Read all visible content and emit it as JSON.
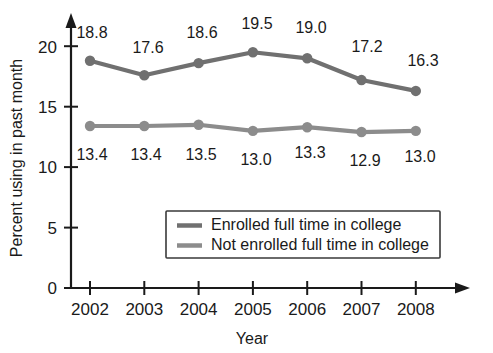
{
  "chart_data": {
    "type": "line",
    "title": "",
    "subtitle": "",
    "xlabel": "Year",
    "ylabel": "Percent using in past month",
    "categories": [
      "2002",
      "2003",
      "2004",
      "2005",
      "2006",
      "2007",
      "2008"
    ],
    "x": [
      2002,
      2003,
      2004,
      2005,
      2006,
      2007,
      2008
    ],
    "xlim": [
      2001.55,
      2008.7
    ],
    "ylim": [
      0,
      21.5
    ],
    "yticks": [
      0,
      5,
      10,
      15,
      20
    ],
    "ytick_labels": [
      "0",
      "5",
      "10",
      "15",
      "20"
    ],
    "xticks": [
      2002,
      2003,
      2004,
      2005,
      2006,
      2007,
      2008
    ],
    "grid": false,
    "legend_position": "inside-lower-center",
    "series": [
      {
        "name": "Enrolled full time in college",
        "color": "#707070",
        "marker": "circle",
        "values": [
          18.8,
          17.6,
          18.6,
          19.5,
          19.0,
          17.2,
          16.3
        ],
        "data_labels": [
          "18.8",
          "17.6",
          "18.6",
          "19.5",
          "19.0",
          "17.2",
          "16.3"
        ],
        "label_position": "above"
      },
      {
        "name": "Not enrolled full time in college",
        "color": "#8c8c8c",
        "marker": "circle",
        "values": [
          13.4,
          13.4,
          13.5,
          13.0,
          13.3,
          12.9,
          13.0
        ],
        "data_labels": [
          "13.4",
          "13.4",
          "13.5",
          "13.0",
          "13.3",
          "12.9",
          "13.0"
        ],
        "label_position": "below"
      }
    ]
  },
  "legend": {
    "entries": [
      {
        "label": "Enrolled full time in college",
        "color": "#707070"
      },
      {
        "label": "Not enrolled full time in college",
        "color": "#8c8c8c"
      }
    ]
  },
  "axes": {
    "y_title": "Percent using in past month",
    "x_title": "Year"
  },
  "colors": {
    "series_enrolled": "#707070",
    "series_not_enrolled": "#8c8c8c",
    "axis": "#1a1a1a",
    "text": "#1a1a1a",
    "background": "#ffffff",
    "legend_border": "#3a3a3a"
  }
}
